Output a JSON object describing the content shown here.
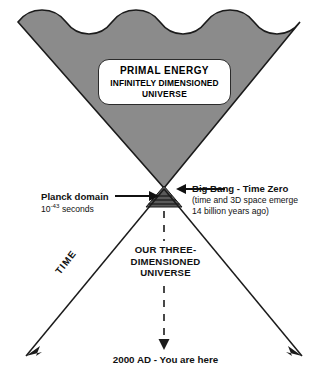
{
  "figure": {
    "title_box": {
      "line1": "PRIMAL ENERGY",
      "line2": "INFINITELY DIMENSIONED",
      "line3": "UNIVERSE"
    },
    "planck": {
      "label": "Planck domain",
      "value_base": "10",
      "value_exponent": "-43",
      "value_unit": " seconds"
    },
    "big_bang": {
      "label": "Big Bang - Time Zero",
      "note_line1": "(time and 3D space emerge",
      "note_line2": "14 billion years ago)"
    },
    "our_universe": {
      "caption": "OUR THREE-DIMENSIONED UNIVERSE"
    },
    "time_axis": {
      "label": "TIME"
    },
    "present": {
      "caption": "2000 AD - You are here"
    },
    "colors": {
      "primal_fill": "#8b8b8b",
      "outline": "#1b1b1b",
      "planck_fill": "#5d5d5d",
      "planck_stripe": "#161616",
      "background": "#ffffff"
    },
    "icons": {
      "planck_arrow": "arrow-right-icon",
      "big_bang_arrow": "arrow-left-icon",
      "time_arrow_left": "arrow-down-left-icon",
      "time_arrow_right": "arrow-down-right-icon",
      "present_arrow": "arrow-down-dashed-icon"
    }
  }
}
